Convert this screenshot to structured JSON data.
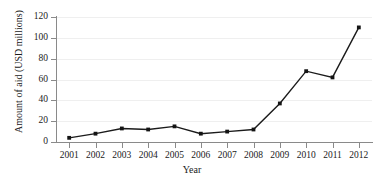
{
  "chart_data": {
    "type": "line",
    "title": "",
    "xlabel": "Year",
    "ylabel": "Amount of aid (USD millions)",
    "categories": [
      "2001",
      "2002",
      "2003",
      "2004",
      "2005",
      "2006",
      "2007",
      "2008",
      "2009",
      "2010",
      "2011",
      "2012"
    ],
    "values": [
      4,
      8,
      13,
      12,
      15,
      8,
      10,
      12,
      37,
      68,
      62,
      110
    ],
    "series": [
      {
        "name": "Amount of aid",
        "values": [
          4,
          8,
          13,
          12,
          15,
          8,
          10,
          12,
          37,
          68,
          62,
          110
        ]
      }
    ],
    "ylim": [
      0,
      120
    ],
    "y_ticks": [
      "0",
      "20",
      "40",
      "60",
      "80",
      "100",
      "120"
    ],
    "y_tick_values": [
      0,
      20,
      40,
      60,
      80,
      100,
      120
    ],
    "grid": "horizontal-faint",
    "legend": "none",
    "line_color": "#1b1b1b",
    "marker": "square"
  }
}
